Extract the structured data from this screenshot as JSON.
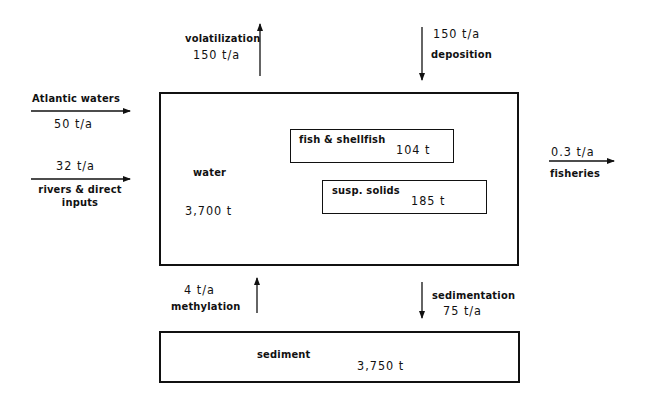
{
  "compartments": {
    "water": {
      "label": "water",
      "amount": "3,700 t"
    },
    "fish": {
      "label": "fish & shellfish",
      "amount": "104 t"
    },
    "susp": {
      "label": "susp. solids",
      "amount": "185 t"
    },
    "sediment": {
      "label": "sediment",
      "amount": "3,750 t"
    }
  },
  "flows": {
    "atlantic": {
      "label": "Atlantic waters",
      "value": "50 t/a"
    },
    "rivers": {
      "value": "32 t/a",
      "label_line1": "rivers & direct",
      "label_line2": "inputs"
    },
    "volatilization": {
      "label": "volatilization",
      "value": "150 t/a"
    },
    "deposition": {
      "value": "150 t/a",
      "label": "deposition"
    },
    "fisheries": {
      "value": "0.3 t/a",
      "label": "fisheries"
    },
    "methylation": {
      "value": "4 t/a",
      "label": "methylation"
    },
    "sedimentation": {
      "label": "sedimentation",
      "value": "75 t/a"
    }
  },
  "colors": {
    "ink": "#111111",
    "background": "#ffffff"
  }
}
